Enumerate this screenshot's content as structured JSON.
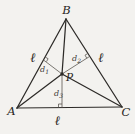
{
  "figure": {
    "vertices": {
      "top": "B",
      "bottom_left": "A",
      "bottom_right": "C"
    },
    "point": "P",
    "side_labels": {
      "left": "ℓ",
      "right": "ℓ",
      "bottom": "ℓ"
    },
    "distance_labels": {
      "d1": {
        "base": "d",
        "sub": "1"
      },
      "d2": {
        "base": "d",
        "sub": "2"
      },
      "d3": {
        "base": "d",
        "sub": "3"
      }
    },
    "colors": {
      "background": "#f3f2ef",
      "main_line": "#2d2b28",
      "thin_line": "#5a5750",
      "text": "#282522"
    }
  }
}
